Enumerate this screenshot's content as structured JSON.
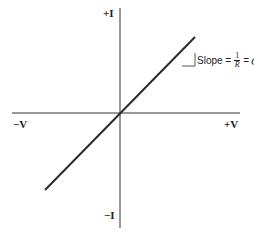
{
  "diagram": {
    "axes": {
      "y_positive_label": "+I",
      "y_negative_label": "−I",
      "x_positive_label": "+V",
      "x_negative_label": "−V"
    },
    "annotation": {
      "prefix": "Slope =",
      "numerator": "1",
      "denominator": "R",
      "equals": "=",
      "result": "G"
    },
    "colors": {
      "axis": "#777777",
      "line": "#2a2a2a",
      "text": "#222222"
    }
  }
}
